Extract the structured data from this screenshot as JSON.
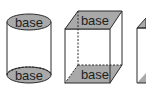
{
  "figure": {
    "colors": {
      "base_fill": "#a9a9a9",
      "stroke": "#2a2a2a",
      "background": "#ffffff"
    },
    "shapes": [
      {
        "name": "cylinder",
        "top_label": "base",
        "bottom_label": "base"
      },
      {
        "name": "rectangular-prism",
        "top_label": "base",
        "bottom_label": "base"
      },
      {
        "name": "partial-prism",
        "top_label": "",
        "bottom_label": ""
      }
    ]
  }
}
